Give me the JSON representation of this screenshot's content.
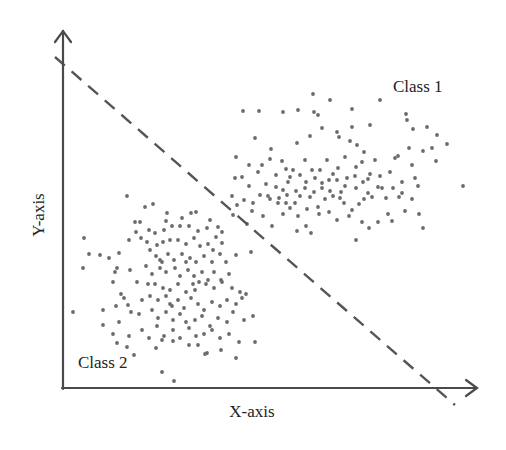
{
  "chart_data": {
    "type": "scatter",
    "title": "",
    "xlabel": "X-axis",
    "ylabel": "Y-axis",
    "grid": false,
    "legend": "none (inline class annotations)",
    "annotations": [
      {
        "text": "Class 1",
        "x": 393,
        "y": 92
      },
      {
        "text": "Class 2",
        "x": 78,
        "y": 368
      }
    ],
    "decision_boundary": {
      "style": "dashed",
      "from": [
        55,
        57
      ],
      "to": [
        455,
        405
      ]
    },
    "axes": {
      "origin": [
        63,
        388
      ],
      "y_top": [
        63,
        30
      ],
      "x_right": [
        477,
        388
      ]
    },
    "colors": {
      "points": "#6b6b6b",
      "axes": "#4a4a4a",
      "boundary": "#555555",
      "text": "#222222"
    },
    "series": [
      {
        "name": "Class 1",
        "points": [
          [
            313,
            94
          ],
          [
            330,
            100
          ],
          [
            380,
            100
          ],
          [
            243,
            111
          ],
          [
            259,
            111
          ],
          [
            283,
            112
          ],
          [
            298,
            110
          ],
          [
            314,
            112
          ],
          [
            318,
            115
          ],
          [
            352,
            109
          ],
          [
            406,
            114
          ],
          [
            407,
            120
          ],
          [
            352,
            127
          ],
          [
            370,
            125
          ],
          [
            322,
            128
          ],
          [
            337,
            132
          ],
          [
            255,
            138
          ],
          [
            310,
            136
          ],
          [
            350,
            141
          ],
          [
            339,
            137
          ],
          [
            413,
            129
          ],
          [
            427,
            127
          ],
          [
            437,
            135
          ],
          [
            432,
            148
          ],
          [
            357,
            145
          ],
          [
            398,
            156
          ],
          [
            423,
            151
          ],
          [
            436,
            161
          ],
          [
            447,
            144
          ],
          [
            463,
            186
          ],
          [
            409,
            148
          ],
          [
            364,
            152
          ],
          [
            236,
            157
          ],
          [
            249,
            165
          ],
          [
            282,
            161
          ],
          [
            271,
            149
          ],
          [
            286,
            169
          ],
          [
            290,
            177
          ],
          [
            297,
            143
          ],
          [
            305,
            160
          ],
          [
            312,
            170
          ],
          [
            320,
            170
          ],
          [
            327,
            160
          ],
          [
            338,
            168
          ],
          [
            345,
            157
          ],
          [
            356,
            167
          ],
          [
            362,
            162
          ],
          [
            370,
            174
          ],
          [
            375,
            160
          ],
          [
            390,
            172
          ],
          [
            395,
            158
          ],
          [
            412,
            165
          ],
          [
            415,
            178
          ],
          [
            418,
            186
          ],
          [
            402,
            182
          ],
          [
            382,
            188
          ],
          [
            368,
            179
          ],
          [
            356,
            188
          ],
          [
            345,
            186
          ],
          [
            337,
            180
          ],
          [
            330,
            191
          ],
          [
            322,
            183
          ],
          [
            314,
            192
          ],
          [
            306,
            182
          ],
          [
            296,
            191
          ],
          [
            288,
            182
          ],
          [
            279,
            198
          ],
          [
            266,
            184
          ],
          [
            258,
            172
          ],
          [
            249,
            186
          ],
          [
            242,
            177
          ],
          [
            235,
            178
          ],
          [
            232,
            196
          ],
          [
            244,
            200
          ],
          [
            253,
            203
          ],
          [
            260,
            195
          ],
          [
            268,
            196
          ],
          [
            278,
            203
          ],
          [
            286,
            203
          ],
          [
            295,
            203
          ],
          [
            300,
            196
          ],
          [
            307,
            209
          ],
          [
            318,
            207
          ],
          [
            325,
            199
          ],
          [
            333,
            196
          ],
          [
            344,
            203
          ],
          [
            352,
            210
          ],
          [
            359,
            204
          ],
          [
            368,
            193
          ],
          [
            378,
            187
          ],
          [
            386,
            198
          ],
          [
            393,
            188
          ],
          [
            402,
            193
          ],
          [
            412,
            199
          ],
          [
            419,
            214
          ],
          [
            423,
            228
          ],
          [
            405,
            211
          ],
          [
            388,
            214
          ],
          [
            378,
            222
          ],
          [
            369,
            228
          ],
          [
            362,
            222
          ],
          [
            356,
            240
          ],
          [
            349,
            216
          ],
          [
            337,
            220
          ],
          [
            329,
            212
          ],
          [
            319,
            214
          ],
          [
            306,
            226
          ],
          [
            298,
            216
          ],
          [
            290,
            208
          ],
          [
            283,
            214
          ],
          [
            272,
            226
          ],
          [
            263,
            216
          ],
          [
            252,
            211
          ],
          [
            247,
            224
          ],
          [
            237,
            205
          ],
          [
            233,
            215
          ],
          [
            392,
            221
          ],
          [
            399,
            197
          ],
          [
            364,
            199
          ],
          [
            341,
            192
          ],
          [
            297,
            231
          ],
          [
            311,
            233
          ],
          [
            270,
            199
          ],
          [
            276,
            187
          ],
          [
            283,
            190
          ],
          [
            293,
            170
          ],
          [
            300,
            175
          ],
          [
            315,
            178
          ],
          [
            322,
            188
          ],
          [
            329,
            180
          ],
          [
            340,
            198
          ],
          [
            347,
            178
          ],
          [
            355,
            176
          ],
          [
            363,
            182
          ],
          [
            372,
            197
          ],
          [
            380,
            176
          ],
          [
            270,
            159
          ],
          [
            276,
            175
          ],
          [
            262,
            165
          ],
          [
            305,
            188
          ],
          [
            310,
            197
          ],
          [
            333,
            174
          ],
          [
            287,
            195
          ]
        ]
      },
      {
        "name": "Class 2",
        "points": [
          [
            127,
            196
          ],
          [
            145,
            207
          ],
          [
            153,
            204
          ],
          [
            167,
            213
          ],
          [
            166,
            221
          ],
          [
            182,
            218
          ],
          [
            191,
            213
          ],
          [
            196,
            212
          ],
          [
            210,
            220
          ],
          [
            218,
            227
          ],
          [
            222,
            232
          ],
          [
            135,
            222
          ],
          [
            140,
            222
          ],
          [
            149,
            230
          ],
          [
            155,
            233
          ],
          [
            164,
            230
          ],
          [
            172,
            226
          ],
          [
            180,
            226
          ],
          [
            189,
            226
          ],
          [
            198,
            231
          ],
          [
            207,
            228
          ],
          [
            216,
            237
          ],
          [
            84,
            238
          ],
          [
            129,
            240
          ],
          [
            136,
            232
          ],
          [
            141,
            238
          ],
          [
            147,
            242
          ],
          [
            157,
            245
          ],
          [
            163,
            242
          ],
          [
            170,
            240
          ],
          [
            178,
            240
          ],
          [
            186,
            244
          ],
          [
            194,
            238
          ],
          [
            200,
            246
          ],
          [
            208,
            244
          ],
          [
            213,
            250
          ],
          [
            222,
            243
          ],
          [
            236,
            255
          ],
          [
            251,
            252
          ],
          [
            89,
            254
          ],
          [
            100,
            255
          ],
          [
            109,
            258
          ],
          [
            119,
            253
          ],
          [
            150,
            250
          ],
          [
            156,
            256
          ],
          [
            162,
            262
          ],
          [
            168,
            254
          ],
          [
            174,
            260
          ],
          [
            182,
            254
          ],
          [
            190,
            258
          ],
          [
            196,
            262
          ],
          [
            204,
            256
          ],
          [
            212,
            262
          ],
          [
            220,
            254
          ],
          [
            226,
            262
          ],
          [
            83,
            268
          ],
          [
            115,
            272
          ],
          [
            117,
            268
          ],
          [
            130,
            270
          ],
          [
            146,
            266
          ],
          [
            152,
            274
          ],
          [
            160,
            268
          ],
          [
            166,
            272
          ],
          [
            175,
            268
          ],
          [
            180,
            276
          ],
          [
            188,
            270
          ],
          [
            194,
            276
          ],
          [
            202,
            272
          ],
          [
            208,
            280
          ],
          [
            214,
            272
          ],
          [
            221,
            280
          ],
          [
            229,
            274
          ],
          [
            137,
            282
          ],
          [
            148,
            284
          ],
          [
            155,
            284
          ],
          [
            163,
            288
          ],
          [
            170,
            290
          ],
          [
            178,
            284
          ],
          [
            186,
            292
          ],
          [
            193,
            284
          ],
          [
            199,
            282
          ],
          [
            206,
            284
          ],
          [
            214,
            288
          ],
          [
            222,
            282
          ],
          [
            232,
            288
          ],
          [
            240,
            292
          ],
          [
            246,
            294
          ],
          [
            124,
            298
          ],
          [
            128,
            305
          ],
          [
            142,
            300
          ],
          [
            150,
            296
          ],
          [
            158,
            300
          ],
          [
            166,
            296
          ],
          [
            172,
            306
          ],
          [
            178,
            300
          ],
          [
            184,
            308
          ],
          [
            191,
            298
          ],
          [
            198,
            304
          ],
          [
            204,
            310
          ],
          [
            212,
            302
          ],
          [
            220,
            306
          ],
          [
            227,
            300
          ],
          [
            236,
            304
          ],
          [
            242,
            298
          ],
          [
            103,
            310
          ],
          [
            116,
            306
          ],
          [
            131,
            312
          ],
          [
            139,
            314
          ],
          [
            152,
            310
          ],
          [
            158,
            318
          ],
          [
            166,
            312
          ],
          [
            173,
            320
          ],
          [
            180,
            314
          ],
          [
            186,
            322
          ],
          [
            195,
            320
          ],
          [
            202,
            316
          ],
          [
            210,
            326
          ],
          [
            218,
            318
          ],
          [
            227,
            322
          ],
          [
            233,
            312
          ],
          [
            244,
            320
          ],
          [
            253,
            316
          ],
          [
            73,
            312
          ],
          [
            103,
            325
          ],
          [
            113,
            334
          ],
          [
            119,
            322
          ],
          [
            129,
            336
          ],
          [
            142,
            330
          ],
          [
            149,
            338
          ],
          [
            157,
            326
          ],
          [
            164,
            336
          ],
          [
            173,
            330
          ],
          [
            180,
            338
          ],
          [
            189,
            328
          ],
          [
            196,
            336
          ],
          [
            204,
            334
          ],
          [
            212,
            330
          ],
          [
            220,
            338
          ],
          [
            229,
            334
          ],
          [
            239,
            342
          ],
          [
            255,
            342
          ],
          [
            117,
            343
          ],
          [
            127,
            347
          ],
          [
            134,
            355
          ],
          [
            156,
            348
          ],
          [
            162,
            340
          ],
          [
            173,
            341
          ],
          [
            189,
            345
          ],
          [
            198,
            345
          ],
          [
            207,
            353
          ],
          [
            221,
            350
          ],
          [
            236,
            358
          ],
          [
            205,
            354
          ],
          [
            162,
            372
          ],
          [
            174,
            381
          ],
          [
            113,
            282
          ],
          [
            121,
            294
          ],
          [
            160,
            260
          ],
          [
            186,
            262
          ],
          [
            170,
            304
          ],
          [
            195,
            290
          ]
        ]
      }
    ]
  },
  "labels": {
    "x_axis": "X-axis",
    "y_axis": "Y-axis",
    "class_1": "Class 1",
    "class_2": "Class 2"
  }
}
